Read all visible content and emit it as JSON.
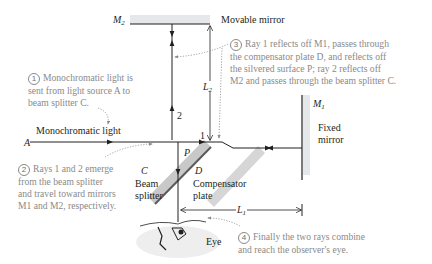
{
  "diagram": {
    "labels": {
      "m2": "M",
      "m2_sub": "2",
      "movable_mirror": "Movable mirror",
      "m1": "M",
      "m1_sub": "1",
      "fixed_mirror_line1": "Fixed",
      "fixed_mirror_line2": "mirror",
      "source_a": "A",
      "monochromatic_light": "Monochromatic light",
      "ray1": "1",
      "ray2": "2",
      "point_p": "P",
      "c": "C",
      "beam_splitter_line1": "Beam",
      "beam_splitter_line2": "splitter",
      "d": "D",
      "compensator_line1": "Compensator",
      "compensator_line2": "plate",
      "l1": "L",
      "l1_sub": "1",
      "l2": "L",
      "l2_sub": "2",
      "eye": "Eye"
    },
    "notes": [
      {
        "number": "1",
        "lines": [
          "Monochromatic light is",
          "sent from light source A to",
          "beam splitter C."
        ]
      },
      {
        "number": "2",
        "lines": [
          "Rays 1 and 2 emerge",
          "from the beam splitter",
          "and travel toward mirrors",
          "M1 and M2, respectively."
        ]
      },
      {
        "number": "3",
        "lines": [
          "Ray 1 reflects off M1, passes through",
          "the compensator plate D, and reflects off",
          "the silvered surface P; ray 2 reflects off",
          "M2 and passes through the beam splitter C."
        ]
      },
      {
        "number": "4",
        "lines": [
          "Finally the two rays combine",
          "and reach the observer's eye."
        ]
      }
    ],
    "colors": {
      "ray": "#231f20",
      "mirror_fill": "#e6e7e8",
      "plate_fill": "#c8c8c8",
      "note_text": "#8a8a8a",
      "label_text": "#231f20"
    }
  }
}
